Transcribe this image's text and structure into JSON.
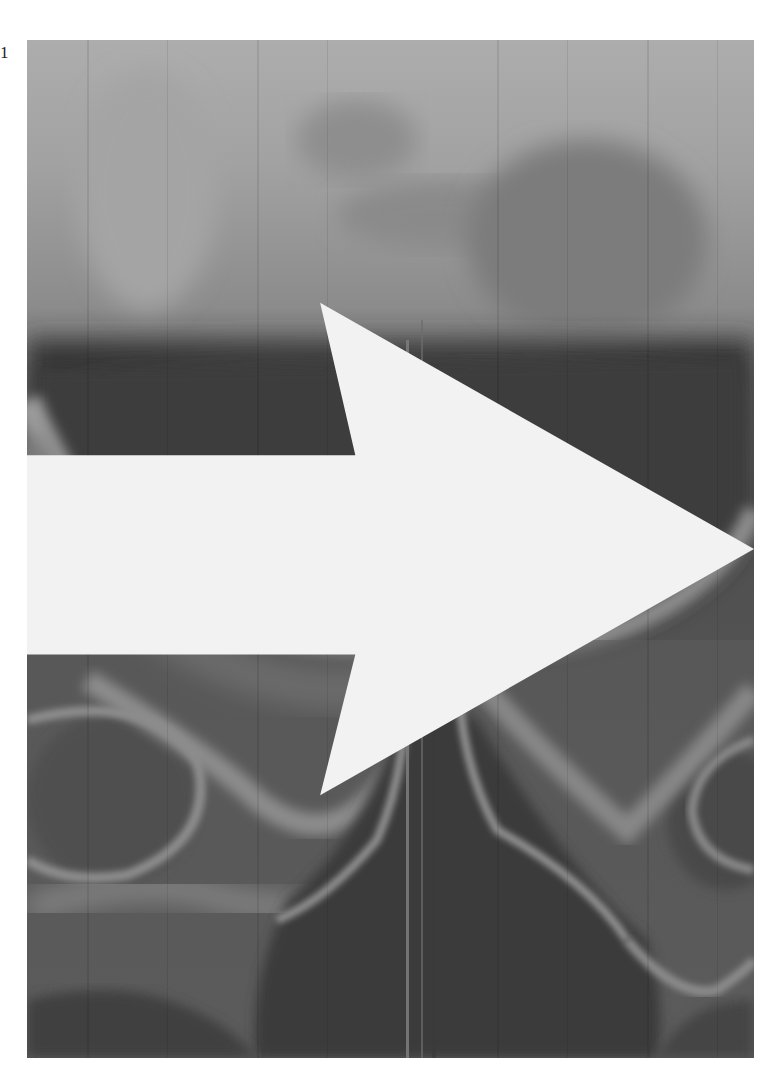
{
  "figure": {
    "label": "1",
    "image_type": "pelvic radiograph (grayscale)",
    "annotation": {
      "type": "arrow",
      "direction": "right",
      "color": "#f2f2f2",
      "icon": "arrow-right-icon"
    }
  },
  "colors": {
    "background": "#ffffff",
    "image_top": "#a9a9a9",
    "image_dark": "#3c3c3c",
    "bone_light": "#9a9a9a",
    "pelvis_mid": "#5e5e5e"
  }
}
